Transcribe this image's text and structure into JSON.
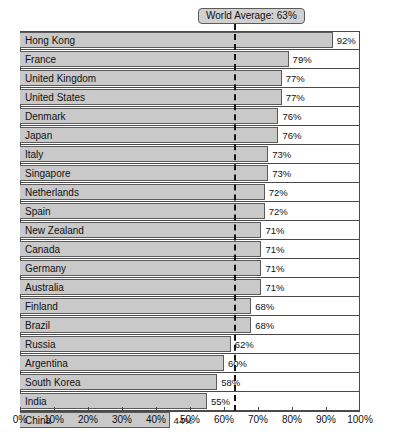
{
  "chart_data": {
    "type": "bar",
    "orientation": "horizontal",
    "title": "",
    "xlabel": "",
    "ylabel": "",
    "xlim": [
      0,
      100
    ],
    "grid": false,
    "unit": "%",
    "categories": [
      "Hong Kong",
      "France",
      "United Kingdom",
      "United States",
      "Denmark",
      "Japan",
      "Italy",
      "Singapore",
      "Netherlands",
      "Spain",
      "New Zealand",
      "Canada",
      "Germany",
      "Australia",
      "Finland",
      "Brazil",
      "Russia",
      "Argentina",
      "South Korea",
      "India",
      "China"
    ],
    "values": [
      92,
      79,
      77,
      77,
      76,
      76,
      73,
      73,
      72,
      72,
      71,
      71,
      71,
      71,
      68,
      68,
      62,
      60,
      58,
      55,
      44
    ],
    "value_labels": [
      "92%",
      "79%",
      "77%",
      "77%",
      "76%",
      "76%",
      "73%",
      "73%",
      "72%",
      "72%",
      "71%",
      "71%",
      "71%",
      "71%",
      "68%",
      "68%",
      "62%",
      "60%",
      "58%",
      "55%",
      "44%"
    ],
    "tick_values": [
      0,
      10,
      20,
      30,
      40,
      50,
      60,
      70,
      80,
      90,
      100
    ],
    "tick_labels": [
      "0%",
      "10%",
      "20%",
      "30%",
      "40%",
      "50%",
      "60%",
      "70%",
      "80%",
      "90%",
      "100%"
    ],
    "annotations": [
      {
        "name": "world-average",
        "label": "World Average: 63%",
        "value": 63,
        "style": "dashed-vertical-line"
      }
    ],
    "colors": {
      "bar_fill": "#c9c9c9",
      "bar_border": "#5a5a5a",
      "frame": "#4a4a4a",
      "average_line": "#141414",
      "callout_fill": "#d0d0d0",
      "callout_border": "#5a5a5a",
      "text": "#111111",
      "background": "#ffffff"
    }
  }
}
